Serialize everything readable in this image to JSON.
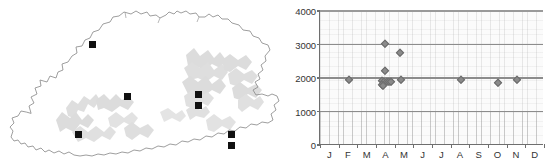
{
  "figure": {
    "panels": [
      "distribution-map",
      "altitude-month-scatter"
    ]
  },
  "map": {
    "region_name": "Bhutan",
    "outline_color": "#8d8d8d",
    "relief_color": "#d9d9d9",
    "marker_color": "#111111",
    "marker_shape": "square",
    "marker_count": 7,
    "markers": [
      {
        "id": "loc-1",
        "x": 93,
        "y": 45
      },
      {
        "id": "loc-2",
        "x": 128,
        "y": 97
      },
      {
        "id": "loc-3",
        "x": 199,
        "y": 95
      },
      {
        "id": "loc-4",
        "x": 199,
        "y": 106
      },
      {
        "id": "loc-5",
        "x": 79,
        "y": 135
      },
      {
        "id": "loc-6",
        "x": 232,
        "y": 135
      },
      {
        "id": "loc-7",
        "x": 232,
        "y": 146
      }
    ]
  },
  "chart_data": {
    "type": "scatter",
    "title": "",
    "xlabel": "",
    "ylabel": "",
    "xlim": [
      0,
      12
    ],
    "ylim": [
      0,
      4000
    ],
    "grid": true,
    "legend": null,
    "categories": [
      "J",
      "F",
      "M",
      "A",
      "M",
      "J",
      "J",
      "A",
      "S",
      "O",
      "N",
      "D"
    ],
    "xtick_labels": [
      "J",
      "F",
      "M",
      "A",
      "M",
      "J",
      "J",
      "A",
      "S",
      "O",
      "N",
      "D"
    ],
    "ytick_labels": [
      "0",
      "1000",
      "2000",
      "3000",
      "4000"
    ],
    "ytick_values": [
      0,
      1000,
      2000,
      3000,
      4000
    ],
    "gridline_values": [
      1000,
      2000,
      3000,
      4000
    ],
    "marker_shape": "diamond",
    "marker_color": "#8a8a8a",
    "points": [
      {
        "month": "F",
        "x": 1.55,
        "y": 1930
      },
      {
        "month": "A",
        "x": 3.5,
        "y": 3010
      },
      {
        "month": "A",
        "x": 3.5,
        "y": 2220
      },
      {
        "month": "A",
        "x": 3.3,
        "y": 1900
      },
      {
        "month": "A",
        "x": 3.42,
        "y": 1870
      },
      {
        "month": "A",
        "x": 3.3,
        "y": 1790
      },
      {
        "month": "A",
        "x": 3.38,
        "y": 1760
      },
      {
        "month": "A",
        "x": 3.58,
        "y": 1880
      },
      {
        "month": "A",
        "x": 3.7,
        "y": 1880
      },
      {
        "month": "A",
        "x": 3.8,
        "y": 1870
      },
      {
        "month": "M",
        "x": 4.3,
        "y": 2760
      },
      {
        "month": "M",
        "x": 4.35,
        "y": 1930
      },
      {
        "month": "A2",
        "x": 7.55,
        "y": 1930
      },
      {
        "month": "O",
        "x": 9.55,
        "y": 1860
      },
      {
        "month": "N",
        "x": 10.55,
        "y": 1930
      }
    ]
  }
}
